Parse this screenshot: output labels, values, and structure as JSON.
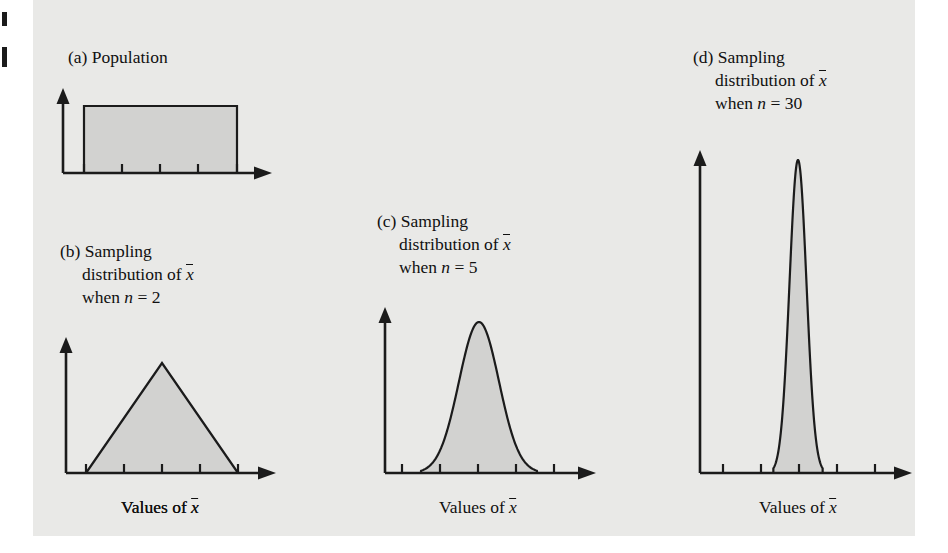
{
  "figure": {
    "background_color": "#e9e9e7",
    "fill_color": "#d2d2d0",
    "stroke_color": "#1b1b1b",
    "text_color": "#101010"
  },
  "panels": [
    {
      "id": "a",
      "letter": "(a)",
      "caption_lines": [
        "(a) Population"
      ],
      "caption_x": 68,
      "caption_y": 46,
      "axis_label_prefix": "Values of ",
      "axis_label_symbol": "x",
      "axis_label_has_bar": false,
      "axis_label_x": 160,
      "axis_label_y": 497,
      "shape": "uniform",
      "origin_x": 63,
      "baseline_y": 173,
      "y_axis_top": 88,
      "x_axis_end": 272,
      "ticks": [
        84,
        122,
        160,
        198,
        237
      ],
      "dist_left": 84,
      "dist_right": 237,
      "peak_y": 106,
      "peak_x": 160
    },
    {
      "id": "b",
      "letter": "(b)",
      "caption_lines": [
        "(b) Sampling",
        "distribution of x̄",
        "when n = 2"
      ],
      "caption_x": 60,
      "caption_y": 240,
      "axis_label_prefix": "Values of ",
      "axis_label_symbol": "x",
      "axis_label_has_bar": true,
      "axis_label_x": 160,
      "axis_label_y": 497,
      "shape": "triangular",
      "origin_x": 66,
      "baseline_y": 473,
      "y_axis_top": 337,
      "x_axis_end": 276,
      "ticks": [
        86,
        124,
        162,
        200,
        238
      ],
      "dist_left": 86,
      "dist_right": 238,
      "peak_y": 363,
      "peak_x": 162
    },
    {
      "id": "c",
      "letter": "(c)",
      "caption_lines": [
        "(c) Sampling",
        "distribution of x̄",
        "when n = 5"
      ],
      "caption_x": 377,
      "caption_y": 210,
      "axis_label_prefix": "Values of ",
      "axis_label_symbol": "x",
      "axis_label_has_bar": true,
      "axis_label_x": 478,
      "axis_label_y": 497,
      "shape": "bell",
      "origin_x": 385,
      "baseline_y": 473,
      "y_axis_top": 307,
      "x_axis_end": 596,
      "ticks": [
        402,
        440,
        478,
        516,
        554
      ],
      "dist_left": 420,
      "dist_right": 540,
      "peak_y": 322,
      "peak_x": 479,
      "sigma": 20
    },
    {
      "id": "d",
      "letter": "(d)",
      "caption_lines": [
        "(d) Sampling",
        "distribution of x̄",
        "when n = 30"
      ],
      "caption_x": 693,
      "caption_y": 46,
      "axis_label_prefix": "Values of ",
      "axis_label_symbol": "x",
      "axis_label_has_bar": true,
      "axis_label_x": 798,
      "axis_label_y": 497,
      "shape": "bell",
      "origin_x": 700,
      "baseline_y": 473,
      "y_axis_top": 150,
      "x_axis_end": 912,
      "ticks": [
        723,
        761,
        799,
        837,
        875
      ],
      "dist_left": 758,
      "dist_right": 840,
      "peak_y": 160,
      "peak_x": 798,
      "sigma": 8.5
    }
  ],
  "chart_data": {
    "type": "area",
    "xlabel": "Values of x̄",
    "ylabel": "",
    "grid": false,
    "legend": "none",
    "series": [
      {
        "name": "(a) Population",
        "distribution": "uniform",
        "sample_size": null,
        "xlabel": "Values of x",
        "relative_peak_height": 0.44,
        "relative_spread": 1.0,
        "note": "Flat rectangular (uniform) population distribution"
      },
      {
        "name": "(b) Sampling distribution of x̄ when n = 2",
        "distribution": "triangular",
        "sample_size": 2,
        "xlabel": "Values of x̄",
        "relative_peak_height": 0.72,
        "relative_spread": 1.0,
        "note": "Triangular; same full range as population, peaked at center"
      },
      {
        "name": "(c) Sampling distribution of x̄ when n = 5",
        "distribution": "normal",
        "sample_size": 5,
        "xlabel": "Values of x̄",
        "relative_peak_height": 0.99,
        "relative_spread": 0.53,
        "note": "Approximately normal, narrower than n = 2"
      },
      {
        "name": "(d) Sampling distribution of x̄ when n = 30",
        "distribution": "normal",
        "sample_size": 30,
        "xlabel": "Values of x̄",
        "relative_peak_height": 2.06,
        "relative_spread": 0.22,
        "note": "Nearly normal, very narrow and tall; illustrates Central Limit Theorem"
      }
    ]
  }
}
